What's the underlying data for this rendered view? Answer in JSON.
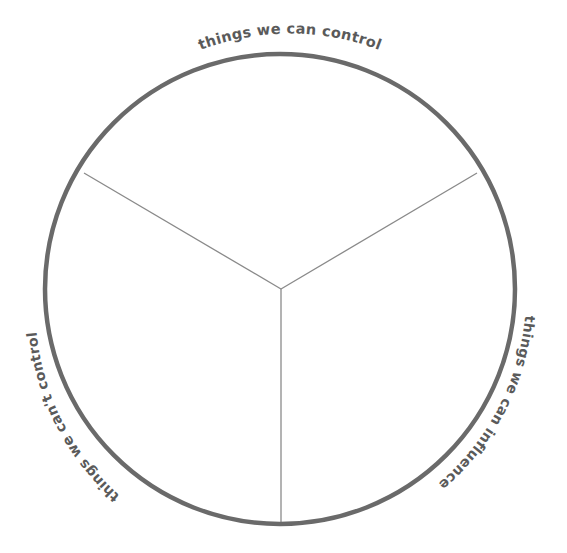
{
  "diagram": {
    "type": "circle-of-control",
    "colors": {
      "ring": "#6a6a6a",
      "spoke": "#8a8a8a",
      "label": "#5a5a5a",
      "background": "#ffffff"
    },
    "sections": [
      {
        "id": "control",
        "label": "things we can control",
        "position": "top"
      },
      {
        "id": "influence",
        "label": "things we can influence",
        "position": "right"
      },
      {
        "id": "cant-control",
        "label": "things we can't control",
        "position": "left"
      }
    ]
  }
}
